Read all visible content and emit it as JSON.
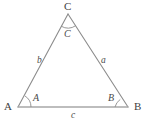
{
  "figure": {
    "type": "triangle-diagram",
    "background_color": "#ffffff",
    "stroke_color": "#8c8c8c",
    "base_stroke_color": "#a8a8a8",
    "text_color": "#4a4a4a",
    "width": 150,
    "height": 123
  },
  "vertices": [
    {
      "name": "A",
      "label": "A",
      "x": 18,
      "y": 107,
      "label_x": 4,
      "label_y": 101
    },
    {
      "name": "B",
      "label": "B",
      "x": 128,
      "y": 107,
      "label_x": 134,
      "label_y": 101
    },
    {
      "name": "C",
      "label": "C",
      "x": 68,
      "y": 14,
      "label_x": 64,
      "label_y": 1
    }
  ],
  "angles": [
    {
      "at": "A",
      "label": "A",
      "label_x": 33,
      "label_y": 93,
      "arc_radius": 13
    },
    {
      "at": "B",
      "label": "B",
      "label_x": 108,
      "label_y": 93,
      "arc_radius": 13
    },
    {
      "at": "C",
      "label": "C",
      "label_x": 64,
      "label_y": 29,
      "arc_radius": 14
    }
  ],
  "sides": [
    {
      "name": "a",
      "label": "a",
      "between": "B-C",
      "label_x": 101,
      "label_y": 56
    },
    {
      "name": "b",
      "label": "b",
      "between": "A-C",
      "label_x": 37,
      "label_y": 56
    },
    {
      "name": "c",
      "label": "c",
      "between": "A-B",
      "label_x": 71,
      "label_y": 111
    }
  ]
}
